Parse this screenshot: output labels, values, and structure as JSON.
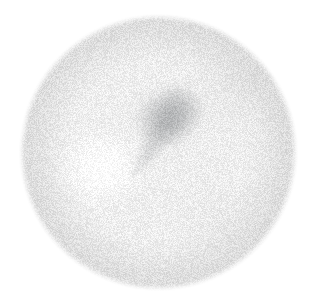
{
  "figure": {
    "medium": "scanned halftone / stipple engraving",
    "color_mode": "grayscale",
    "canvas": {
      "width": 315,
      "height": 302,
      "background_color": "#ffffff"
    },
    "subject": {
      "shape": "circle",
      "center_x": 158,
      "center_y": 152,
      "radius_x": 136,
      "radius_y": 135,
      "edge_softness_px": 9,
      "base_color": "#eeeeee",
      "rim_color": "#dcdcdc"
    },
    "shading": {
      "core_shadow": {
        "name": "central-dark-smudge",
        "center_x": 166,
        "center_y": 118,
        "radius_x": 48,
        "radius_y": 42,
        "darkest_color": "#9c9ea0",
        "opacity": 0.55
      },
      "shadow_tail": {
        "name": "lower-left-wedge",
        "tip_x": 134,
        "tip_y": 172,
        "from_x": 178,
        "from_y": 108,
        "darkest_color": "#a6a8aa",
        "opacity": 0.5
      },
      "highlight": {
        "name": "left-specular-highlight",
        "center_x": 102,
        "center_y": 168,
        "radius_x": 54,
        "radius_y": 48,
        "color": "#ffffff",
        "opacity": 0.95
      },
      "upper_right_band": {
        "name": "upper-right-shading",
        "center_x": 232,
        "center_y": 86,
        "color": "#d2d2d2",
        "opacity": 0.35
      },
      "lower_right_band": {
        "name": "lower-right-shading",
        "center_x": 226,
        "center_y": 222,
        "color": "#d6d6d6",
        "opacity": 0.3
      }
    },
    "texture": {
      "type": "stipple-grain",
      "grain_amplitude": 15,
      "grain_scale_px": 1,
      "seed": 20240517
    },
    "tones": {
      "background": "#ffffff",
      "lightest": "#fdfdfd",
      "mid": "#ececec",
      "dark": "#b4b6b8",
      "darkest": "#9a9c9e"
    }
  }
}
